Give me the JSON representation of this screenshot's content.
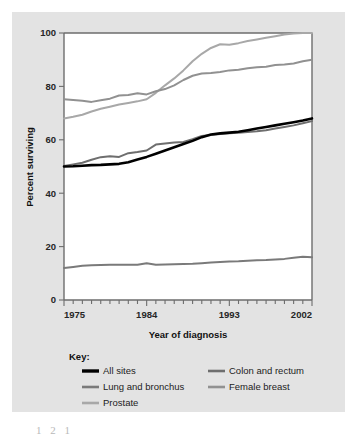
{
  "figure": {
    "panel_background": "#e3e3e3",
    "plot_background": "#ffffff",
    "axis_color": "#6d6d6d"
  },
  "chart_data": {
    "type": "line",
    "title": "",
    "xlabel": "Year of diagnosis",
    "ylabel": "Percent surviving",
    "xlim": [
      1975,
      2002
    ],
    "ylim": [
      0,
      100
    ],
    "xticks": [
      1975,
      1984,
      1993,
      2002
    ],
    "xtick_labels": [
      "1975",
      "1984",
      "1993",
      "2002"
    ],
    "yticks": [
      0,
      20,
      40,
      60,
      80,
      100
    ],
    "ytick_labels": [
      "0",
      "20",
      "40",
      "60",
      "80",
      "100"
    ],
    "minor_xtick_interval": 1,
    "grid": false,
    "legend_position": "below",
    "legend_title": "Key:",
    "x": [
      1975,
      1976,
      1977,
      1978,
      1979,
      1980,
      1981,
      1982,
      1983,
      1984,
      1985,
      1986,
      1987,
      1988,
      1989,
      1990,
      1991,
      1992,
      1993,
      1994,
      1995,
      1996,
      1997,
      1998,
      1999,
      2000,
      2001,
      2002
    ],
    "series": [
      {
        "name": "All sites",
        "color": "#000000",
        "width": 2.6,
        "values": [
          50.0,
          50.1,
          50.3,
          50.5,
          50.6,
          50.8,
          51.0,
          51.6,
          52.6,
          53.6,
          54.8,
          56.0,
          57.2,
          58.4,
          59.6,
          61.0,
          62.0,
          62.4,
          62.7,
          63.0,
          63.6,
          64.2,
          64.8,
          65.4,
          66.0,
          66.6,
          67.2,
          68.0
        ]
      },
      {
        "name": "Colon and rectum",
        "color": "#6e6e6e",
        "width": 2.0,
        "values": [
          50.2,
          50.8,
          51.4,
          52.5,
          53.5,
          53.8,
          53.6,
          55.0,
          55.4,
          56.0,
          58.2,
          58.6,
          59.0,
          59.2,
          60.2,
          61.4,
          61.8,
          62.2,
          62.5,
          62.6,
          62.9,
          63.2,
          63.6,
          64.2,
          64.8,
          65.4,
          66.2,
          67.0
        ]
      },
      {
        "name": "Lung and bronchus",
        "color": "#7a7a7a",
        "width": 2.0,
        "values": [
          12.0,
          12.4,
          12.8,
          13.0,
          13.1,
          13.2,
          13.2,
          13.2,
          13.2,
          13.8,
          13.2,
          13.3,
          13.4,
          13.5,
          13.6,
          13.8,
          14.0,
          14.2,
          14.4,
          14.5,
          14.7,
          14.9,
          15.0,
          15.2,
          15.4,
          15.8,
          16.2,
          16.0
        ]
      },
      {
        "name": "Female breast",
        "color": "#919191",
        "width": 2.0,
        "values": [
          75.2,
          74.9,
          74.6,
          74.2,
          74.8,
          75.4,
          76.6,
          76.8,
          77.4,
          77.0,
          78.2,
          79.0,
          80.4,
          82.4,
          84.0,
          84.8,
          85.0,
          85.4,
          86.0,
          86.2,
          86.8,
          87.2,
          87.4,
          88.0,
          88.2,
          88.6,
          89.4,
          90.0
        ]
      },
      {
        "name": "Prostate",
        "color": "#a8a8a8",
        "width": 2.0,
        "values": [
          68.0,
          68.6,
          69.4,
          70.6,
          71.6,
          72.4,
          73.2,
          73.8,
          74.4,
          75.2,
          77.6,
          80.4,
          83.0,
          86.0,
          89.4,
          92.2,
          94.4,
          95.8,
          95.6,
          96.2,
          97.0,
          97.6,
          98.2,
          98.8,
          99.4,
          99.8,
          100.0,
          100.0
        ]
      }
    ]
  },
  "legend": {
    "title": "Key:",
    "entries": [
      {
        "label": "All sites",
        "color": "#000000",
        "width": 3.4
      },
      {
        "label": "Colon and rectum",
        "color": "#6e6e6e",
        "width": 2.6
      },
      {
        "label": "Lung and bronchus",
        "color": "#7a7a7a",
        "width": 2.6
      },
      {
        "label": "Female breast",
        "color": "#919191",
        "width": 2.6
      },
      {
        "label": "Prostate",
        "color": "#a8a8a8",
        "width": 2.6
      }
    ]
  },
  "artifact": {
    "text": "1 2 1"
  }
}
